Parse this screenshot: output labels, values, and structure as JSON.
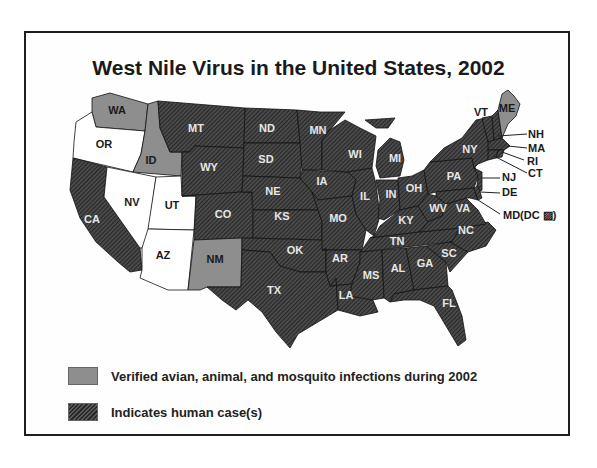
{
  "title": "West Nile Virus in the United States, 2002",
  "colors": {
    "human_case": "#3a3a3a",
    "verified_non_human": "#8e8e8e",
    "no_activity": "#ffffff",
    "border": "#1e1e1e"
  },
  "legend": [
    {
      "key": "verified",
      "label": "Verified avian, animal, and mosquito infections during 2002",
      "swatch": "gray"
    },
    {
      "key": "human",
      "label": "Indicates human case(s)",
      "swatch": "hatched-dark"
    }
  ],
  "states": {
    "human_case": [
      "MT",
      "ND",
      "MN",
      "WI",
      "MI",
      "NY",
      "VT",
      "WY",
      "SD",
      "NE",
      "IA",
      "IL",
      "IN",
      "OH",
      "PA",
      "NJ",
      "DE",
      "MD",
      "DC",
      "CA",
      "CO",
      "KS",
      "MO",
      "KY",
      "WV",
      "VA",
      "OK",
      "AR",
      "TN",
      "NC",
      "MS",
      "AL",
      "GA",
      "SC",
      "TX",
      "LA",
      "FL",
      "NH",
      "MA",
      "RI",
      "CT"
    ],
    "verified_non_human": [
      "WA",
      "ID",
      "NM",
      "ME"
    ],
    "no_activity": [
      "OR",
      "NV",
      "UT",
      "AZ"
    ]
  },
  "labels": {
    "WA": "WA",
    "OR": "OR",
    "ID": "ID",
    "CA": "CA",
    "NV": "NV",
    "UT": "UT",
    "AZ": "AZ",
    "MT": "MT",
    "WY": "WY",
    "CO": "CO",
    "NM": "NM",
    "ND": "ND",
    "SD": "SD",
    "NE": "NE",
    "KS": "KS",
    "OK": "OK",
    "TX": "TX",
    "MN": "MN",
    "IA": "IA",
    "MO": "MO",
    "AR": "AR",
    "LA": "LA",
    "WI": "WI",
    "IL": "IL",
    "MS": "MS",
    "MI": "MI",
    "IN": "IN",
    "OH": "OH",
    "KY": "KY",
    "TN": "TN",
    "AL": "AL",
    "GA": "GA",
    "FL": "FL",
    "SC": "SC",
    "NC": "NC",
    "WV": "WV",
    "VA": "VA",
    "PA": "PA",
    "NY": "NY",
    "VT": "VT",
    "ME": "ME",
    "NH": "NH",
    "MA": "MA",
    "RI": "RI",
    "CT": "CT",
    "NJ": "NJ",
    "DE": "DE",
    "MD": "MD(DC ▨)"
  }
}
